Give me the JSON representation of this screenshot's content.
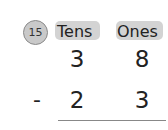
{
  "problem": {
    "number": "15",
    "headers": {
      "tens": "Tens",
      "ones": "Ones"
    },
    "minuend": {
      "tens": "3",
      "ones": "8"
    },
    "operator": "-",
    "subtrahend": {
      "tens": "2",
      "ones": "3"
    }
  }
}
